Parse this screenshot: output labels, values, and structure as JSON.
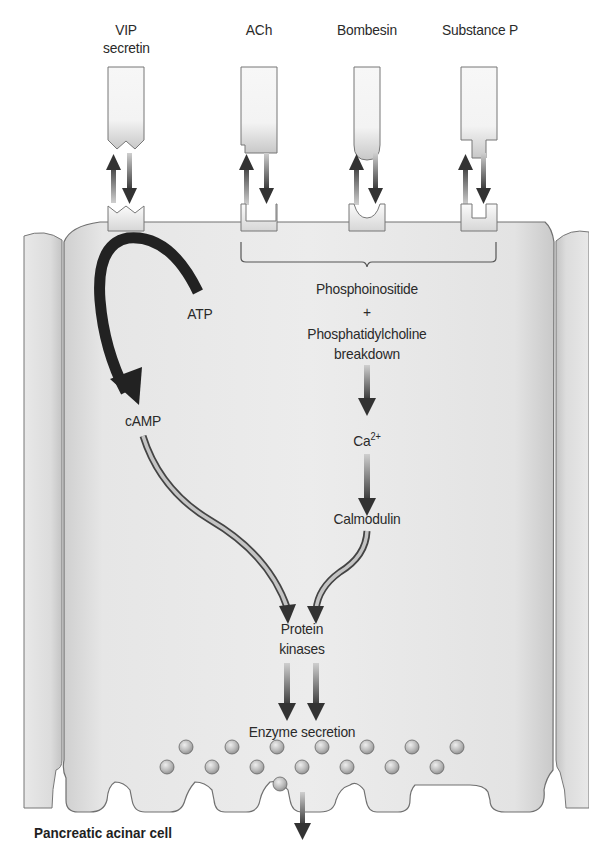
{
  "figure": {
    "caption": "Pancreatic acinar cell",
    "colors": {
      "cell_fill": "#e4e4e4",
      "cell_outline": "#6e6e6e",
      "arrow_dark": "#333333",
      "arrow_light": "#b5b5b5",
      "atp_arrow": "#222222",
      "receptor_fill": "#f2f2f2",
      "vesicle_fill": "#bdbdbd"
    }
  },
  "ligands": [
    {
      "id": "vip",
      "line1": "VIP",
      "line2": "secretin",
      "shape": "notched-v"
    },
    {
      "id": "ach",
      "line1": "ACh",
      "line2": "",
      "shape": "step-left"
    },
    {
      "id": "bombesin",
      "line1": "Bombesin",
      "line2": "",
      "shape": "rounded"
    },
    {
      "id": "substance-p",
      "line1": "Substance P",
      "line2": "",
      "shape": "narrow-tip"
    }
  ],
  "pathway": {
    "camp_branch": {
      "substrate": "ATP",
      "product": "cAMP"
    },
    "calcium_branch": {
      "line1": "Phosphoinositide",
      "plus": "+",
      "line2": "Phosphatidylcholine",
      "line3": "breakdown",
      "ion": "Ca",
      "ion_charge": "2+",
      "mediator": "Calmodulin"
    },
    "converge_line1": "Protein",
    "converge_line2": "kinases",
    "output": "Enzyme secretion"
  },
  "vesicles": {
    "row_top": 7,
    "row_membrane": 8
  }
}
